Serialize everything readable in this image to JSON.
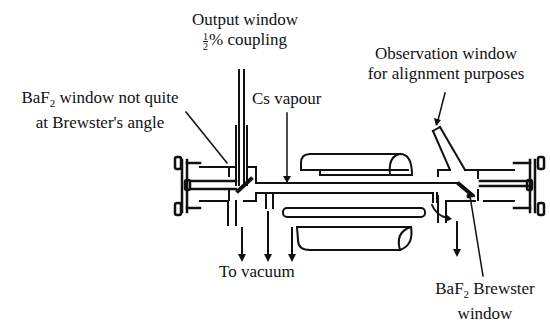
{
  "diagram": {
    "labels": {
      "output_window_line1": "Output window",
      "output_window_coupling_fraction_num": "1",
      "output_window_coupling_fraction_den": "2",
      "output_window_line2": "% coupling",
      "baf2_window_prefix": "BaF",
      "baf2_window_sub": "2",
      "baf2_window_line1_rest": " window not quite",
      "baf2_window_line2": "at Brewster's angle",
      "cs_vapour": "Cs vapour",
      "observation_window_line1": "Observation window",
      "observation_window_line2": "for alignment purposes",
      "to_vacuum": "To vacuum",
      "brewster_window_prefix": "BaF",
      "brewster_window_sub": "2",
      "brewster_window_line1_rest": " Brewster",
      "brewster_window_line2": "window"
    },
    "colors": {
      "ink": "#111111",
      "background": "#ffffff"
    }
  }
}
